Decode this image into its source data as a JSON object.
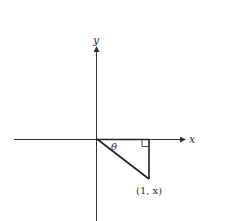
{
  "diagram": {
    "axes": {
      "x_label": "x",
      "y_label": "y"
    },
    "angle_label": "θ",
    "point_label": "(1, x)",
    "colors": {
      "line": "#333333",
      "background": "#ffffff"
    }
  }
}
